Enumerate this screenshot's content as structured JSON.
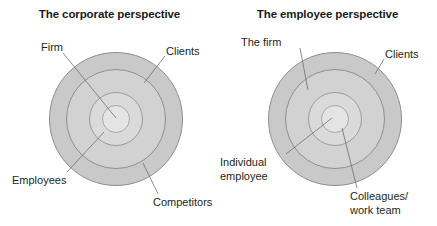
{
  "figure": {
    "background_color": "#ffffff",
    "ring_colors": {
      "outer_fill": "#c9c9c9",
      "mid_fill": "#d2d2d2",
      "inner_fill": "#dadada",
      "core_fill": "#e4e4e4",
      "stroke": "#8e8e8e",
      "leader_line": "#6f6f6f"
    },
    "text_color": "#231f20"
  },
  "panels": [
    {
      "id": "corporate",
      "title": "The corporate perspective",
      "labels": [
        {
          "id": "firm",
          "text": "Firm",
          "target_ring": "core"
        },
        {
          "id": "clients",
          "text": "Clients",
          "target_ring": "outer"
        },
        {
          "id": "employees",
          "text": "Employees",
          "target_ring": "inner"
        },
        {
          "id": "competitors",
          "text": "Competitors",
          "target_ring": "mid"
        }
      ]
    },
    {
      "id": "employee",
      "title": "The employee perspective",
      "labels": [
        {
          "id": "the-firm",
          "text": "The firm",
          "target_ring": "mid"
        },
        {
          "id": "clients",
          "text": "Clients",
          "target_ring": "outer"
        },
        {
          "id": "individual-employee",
          "text_line1": "Individual",
          "text_line2": "employee",
          "target_ring": "core"
        },
        {
          "id": "colleagues-work-team",
          "text_line1": "Colleagues/",
          "text_line2": "work team",
          "target_ring": "inner"
        }
      ]
    }
  ]
}
